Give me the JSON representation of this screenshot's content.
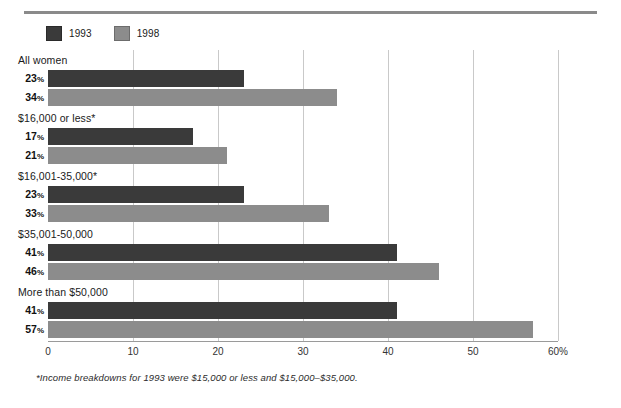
{
  "chart_data": {
    "type": "bar",
    "orientation": "horizontal",
    "title": "",
    "xlabel": "",
    "ylabel": "",
    "xlim": [
      0,
      60
    ],
    "xticks": [
      "0",
      "10",
      "20",
      "30",
      "40",
      "50",
      "60%"
    ],
    "xtick_values": [
      0,
      10,
      20,
      30,
      40,
      50,
      60
    ],
    "grid": true,
    "legend_position": "top-left",
    "categories": [
      "All women",
      "$16,000 or less*",
      "$16,001-35,000*",
      "$35,001-50,000",
      "More than $50,000"
    ],
    "series": [
      {
        "name": "1993",
        "color": "#3a3a3a",
        "values": [
          23,
          17,
          23,
          41,
          41
        ],
        "labels": [
          "23%",
          "17%",
          "23%",
          "41%",
          "41%"
        ]
      },
      {
        "name": "1998",
        "color": "#8c8c8c",
        "values": [
          34,
          21,
          33,
          46,
          57
        ],
        "labels": [
          "34%",
          "21%",
          "33%",
          "46%",
          "57%"
        ]
      }
    ],
    "footnote": "*Income breakdowns for 1993 were $15,000 or less and $15,000–$35,000."
  },
  "legend": {
    "entries": [
      {
        "label": "1993",
        "color": "#3a3a3a"
      },
      {
        "label": "1998",
        "color": "#8c8c8c"
      }
    ]
  },
  "groups": [
    {
      "label": "All women",
      "bars": [
        {
          "series": "1993",
          "number": "23",
          "percent": "%",
          "value": 23
        },
        {
          "series": "1998",
          "number": "34",
          "percent": "%",
          "value": 34
        }
      ]
    },
    {
      "label": "$16,000 or less*",
      "bars": [
        {
          "series": "1993",
          "number": "17",
          "percent": "%",
          "value": 17
        },
        {
          "series": "1998",
          "number": "21",
          "percent": "%",
          "value": 21
        }
      ]
    },
    {
      "label": "$16,001-35,000*",
      "bars": [
        {
          "series": "1993",
          "number": "23",
          "percent": "%",
          "value": 23
        },
        {
          "series": "1998",
          "number": "33",
          "percent": "%",
          "value": 33
        }
      ]
    },
    {
      "label": "$35,001-50,000",
      "bars": [
        {
          "series": "1993",
          "number": "41",
          "percent": "%",
          "value": 41
        },
        {
          "series": "1998",
          "number": "46",
          "percent": "%",
          "value": 46
        }
      ]
    },
    {
      "label": "More than $50,000",
      "bars": [
        {
          "series": "1993",
          "number": "41",
          "percent": "%",
          "value": 41
        },
        {
          "series": "1998",
          "number": "57",
          "percent": "%",
          "value": 57
        }
      ]
    }
  ],
  "axis": {
    "ticks": [
      "0",
      "10",
      "20",
      "30",
      "40",
      "50",
      "60%"
    ]
  },
  "footnote": {
    "text": "*Income breakdowns for 1993 were $15,000 or less and $15,000–$35,000."
  },
  "colors": {
    "series_1993": "#3a3a3a",
    "series_1998": "#8c8c8c",
    "rule": "#8a8a8a",
    "gridline": "#c9c9c9",
    "axis": "#9a9a9a"
  }
}
